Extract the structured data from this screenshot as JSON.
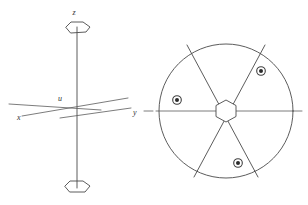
{
  "figure": {
    "colors": {
      "stroke": "#4a4a4a",
      "stroke_light": "#5a5a5a",
      "dot_core": "#2b2b2b",
      "background": "#ffffff",
      "label": "#333333"
    },
    "left_diagram": {
      "name": "coordinate-axes",
      "origin": {
        "x": 77,
        "y": 107
      },
      "labels": [
        {
          "id": "z",
          "text": "z",
          "x": 75,
          "y": 14
        },
        {
          "id": "u",
          "text": "u",
          "x": 58,
          "y": 101
        },
        {
          "id": "x",
          "text": "x",
          "x": 19,
          "y": 119
        },
        {
          "id": "y",
          "text": "y",
          "x": 134,
          "y": 114
        }
      ],
      "vertical_axis": {
        "x": 77,
        "y_top": 27,
        "y_bottom": 188
      },
      "x_axis": {
        "x1": 22,
        "y1": 116,
        "x2": 128,
        "y2": 98
      },
      "y_axis": {
        "x1": 62,
        "y1": 116,
        "x2": 131,
        "y2": 108
      },
      "u_axis": {
        "x1": 9,
        "y1": 105,
        "x2": 100,
        "y2": 111
      },
      "hex_top": {
        "cx": 77,
        "cy": 28,
        "rx": 13,
        "ry": 6
      },
      "hex_bottom": {
        "cx": 77,
        "cy": 187,
        "rx": 13,
        "ry": 6
      }
    },
    "right_diagram": {
      "name": "rotor-cross-section",
      "circle": {
        "cx": 226,
        "cy": 111,
        "r": 67
      },
      "center_hex": {
        "cx": 226,
        "cy": 111,
        "r": 11
      },
      "horizontal_line": {
        "x1": 144,
        "y1": 111,
        "x2": 302,
        "y2": 111
      },
      "spokes": [
        {
          "id": "spoke-upper-left",
          "x1": 187,
          "y1": 45,
          "x2": 258,
          "y2": 177
        },
        {
          "id": "spoke-upper-right",
          "x1": 265,
          "y1": 45,
          "x2": 194,
          "y2": 177
        }
      ],
      "dots": [
        {
          "id": "dot-upper-right",
          "cx": 261,
          "cy": 71,
          "r_ring": 4.3,
          "r_core": 2.0
        },
        {
          "id": "dot-left",
          "cx": 177,
          "cy": 100,
          "r_ring": 4.3,
          "r_core": 2.0
        },
        {
          "id": "dot-lower",
          "cx": 238,
          "cy": 163,
          "r_ring": 4.3,
          "r_core": 2.0
        }
      ],
      "left_tick": {
        "x1": 144,
        "y1": 111,
        "x2": 153,
        "y2": 111
      }
    }
  }
}
